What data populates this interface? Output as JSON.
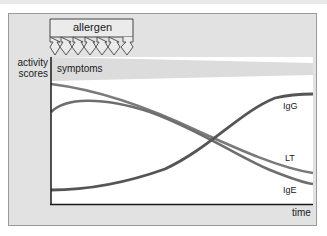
{
  "diagram": {
    "stimulus_label": "allergen",
    "band_label": "symptoms",
    "y_axis_label_line1": "activity",
    "y_axis_label_line2": "scores",
    "x_axis_label": "time",
    "series": [
      {
        "name": "IgG",
        "trend": "low early, rises sigmoidally, plateaus high late"
      },
      {
        "name": "LT",
        "trend": "high early, declines steadily"
      },
      {
        "name": "IgE",
        "trend": "rises to early peak, then declines to lowest"
      }
    ],
    "colors": {
      "frame": "#e2e2e2",
      "band": "#dcdcdc",
      "curve_IgG": "#555555",
      "curve_LT": "#7a7a7a",
      "curve_IgE": "#6e6e6e",
      "axis": "#1a1a1a"
    }
  }
}
